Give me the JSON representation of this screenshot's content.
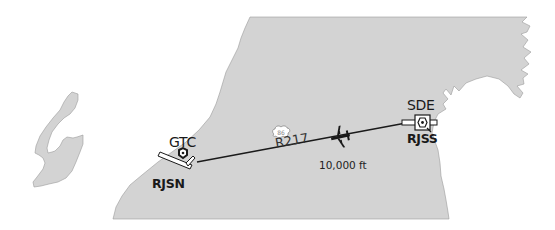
{
  "map": {
    "colors": {
      "land": "#d3d3d3",
      "land_outline": "#9a9a9a",
      "water": "#ffffff",
      "route_line": "#1a1a1a",
      "aircraft": "#1a1a1a"
    },
    "route": {
      "name": "R217",
      "shield_number": "86"
    },
    "aircraft": {
      "altitude": "10,000 ft",
      "icon": "airplane-icon"
    },
    "departure": {
      "navaid": "GTC",
      "airport": "RJSN",
      "icon": "vordme-icon"
    },
    "arrival": {
      "navaid": "SDE",
      "airport": "RJSS",
      "icon": "vordme-icon"
    }
  }
}
